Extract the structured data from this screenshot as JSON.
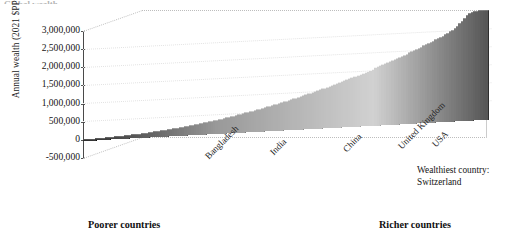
{
  "figure": {
    "title_fragment": "Global wealth",
    "axis_label_y": "Annual wealth (2021 $PPP)",
    "annotation_line1": "Wealthiest country:",
    "annotation_line2": "Switzerland",
    "footer_left": "Poorer countries",
    "footer_right": "Richer countries",
    "accent_color": "#4a4a4a",
    "bar_color_dark": "#2b2b2b",
    "bar_color_mid": "#8d8d8d",
    "bar_color_light": "#cfcfcf",
    "frame_color": "#c2c2c2"
  },
  "chart_data": {
    "type": "bar",
    "title": "Global wealth",
    "xlabel": "",
    "ylabel": "Annual wealth (2021 $PPP)",
    "ylim": [
      -500000,
      3000000
    ],
    "ytick_labels": [
      "3,000,000",
      "2,500,000",
      "2,000,000",
      "1,500,000",
      "1,000,000",
      "500,000",
      "0",
      "-500,000"
    ],
    "ytick_values": [
      3000000,
      2500000,
      2000000,
      1500000,
      1000000,
      500000,
      0,
      -500000
    ],
    "grid": true,
    "legend": "none",
    "projection": "3d-perspective",
    "sorted": "ascending by wealth",
    "xtick_labels": [
      "Bangladesh",
      "India",
      "China",
      "United Kingdom",
      "USA"
    ],
    "xtick_positions": [
      0.3,
      0.46,
      0.64,
      0.78,
      0.865
    ],
    "annotations": [
      {
        "text": "Wealthiest country: Switzerland",
        "position": "right-of-last-bar"
      },
      {
        "text": "Poorer countries",
        "position": "bottom-left"
      },
      {
        "text": "Richer countries",
        "position": "bottom-right"
      }
    ],
    "n_bars": 168,
    "series_name": "Annual wealth per country",
    "values": [
      12000,
      14000,
      16000,
      18000,
      21000,
      24000,
      27000,
      30000,
      33000,
      36000,
      39000,
      42000,
      46000,
      50000,
      54000,
      58000,
      62000,
      66000,
      70000,
      75000,
      80000,
      85000,
      90000,
      95000,
      100000,
      106000,
      112000,
      118000,
      124000,
      130000,
      137000,
      144000,
      151000,
      158000,
      165000,
      173000,
      181000,
      189000,
      197000,
      205000,
      214000,
      223000,
      232000,
      241000,
      250000,
      260000,
      270000,
      280000,
      290000,
      300000,
      311000,
      322000,
      333000,
      344000,
      355000,
      367000,
      379000,
      391000,
      403000,
      415000,
      428000,
      441000,
      454000,
      467000,
      480000,
      494000,
      508000,
      522000,
      536000,
      550000,
      565000,
      580000,
      595000,
      610000,
      625000,
      641000,
      657000,
      673000,
      689000,
      705000,
      722000,
      739000,
      756000,
      773000,
      790000,
      808000,
      826000,
      844000,
      862000,
      880000,
      899000,
      918000,
      937000,
      956000,
      975000,
      995000,
      1015000,
      1035000,
      1055000,
      1075000,
      1096000,
      1117000,
      1138000,
      1159000,
      1180000,
      1202000,
      1224000,
      1246000,
      1268000,
      1290000,
      1313000,
      1336000,
      1359000,
      1382000,
      1405000,
      1429000,
      1453000,
      1477000,
      1501000,
      1525000,
      1550000,
      1575000,
      1600000,
      1625000,
      1650000,
      1676000,
      1702000,
      1728000,
      1754000,
      1780000,
      1807000,
      1834000,
      1861000,
      1888000,
      1915000,
      1943000,
      1971000,
      1999000,
      2027000,
      2055000,
      2084000,
      2113000,
      2142000,
      2171000,
      2200000,
      2230000,
      2260000,
      2290000,
      2320000,
      2351000,
      2385000,
      2420000,
      2460000,
      2505000,
      2555000,
      2612000,
      2675000,
      2742000,
      2812000,
      2880000,
      2930000,
      2962000,
      2980000,
      2992000,
      2998000,
      3000000,
      3005000,
      3010000
    ]
  }
}
